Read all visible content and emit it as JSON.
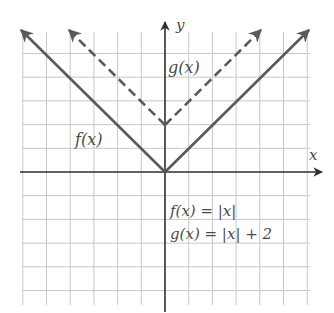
{
  "chart_data": {
    "type": "line",
    "title": "",
    "xlabel": "x",
    "ylabel": "y",
    "xlim": [
      -6,
      6
    ],
    "ylim": [
      -5.7,
      6
    ],
    "grid": true,
    "grid_step": 1,
    "series": [
      {
        "name": "f(x)",
        "formula": "f(x) = |x|",
        "style": "solid",
        "color": "#5a5a5a",
        "points": [
          [
            -6,
            6
          ],
          [
            0,
            0
          ],
          [
            6,
            6
          ]
        ]
      },
      {
        "name": "g(x)",
        "formula": "g(x) = |x| + 2",
        "style": "dashed",
        "color": "#5a5a5a",
        "points": [
          [
            -4,
            6
          ],
          [
            0,
            2
          ],
          [
            4,
            6
          ]
        ]
      }
    ],
    "annotations": [
      {
        "text": "f(x)",
        "x": -3.8,
        "y": 1.3
      },
      {
        "text": "g(x)",
        "x": 0.2,
        "y": 4.3
      },
      {
        "text": "f(x) = |x|",
        "x": 0.2,
        "y": -1.7
      },
      {
        "text": "g(x) = |x| + 2",
        "x": 0.2,
        "y": -2.6
      }
    ]
  },
  "labels": {
    "x_axis": "x",
    "y_axis": "y",
    "f_curve": "f(x)",
    "g_curve": "g(x)",
    "f_equation": "f(x) = |x|",
    "g_equation": "g(x) = |x| + 2"
  },
  "colors": {
    "grid": "#c8c8c8",
    "axis": "#2e2e2e",
    "curve": "#5a5a5a",
    "text": "#4a4a4a"
  }
}
